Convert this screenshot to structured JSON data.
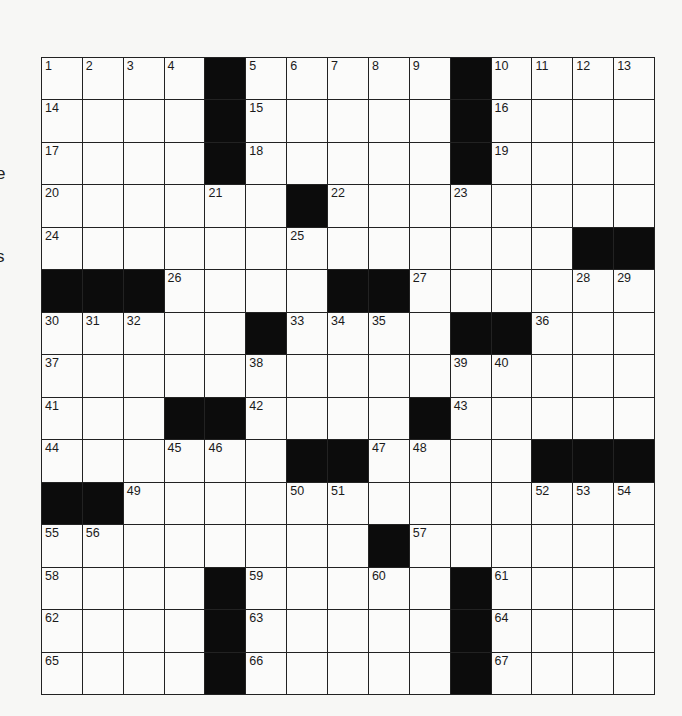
{
  "puzzle": {
    "type": "crossword",
    "size": {
      "rows": 15,
      "cols": 15
    },
    "margin_fragments": [
      {
        "text": "e",
        "top": 164
      },
      {
        "text": "s",
        "top": 247
      }
    ],
    "grid": [
      [
        "1",
        "2",
        "3",
        "4",
        "#",
        "5",
        "6",
        "7",
        "8",
        "9",
        "#",
        "10",
        "11",
        "12",
        "13"
      ],
      [
        "14",
        ".",
        ".",
        ".",
        "#",
        "15",
        ".",
        ".",
        ".",
        ".",
        "#",
        "16",
        ".",
        ".",
        "."
      ],
      [
        "17",
        ".",
        ".",
        ".",
        "#",
        "18",
        ".",
        ".",
        ".",
        ".",
        "#",
        "19",
        ".",
        ".",
        "."
      ],
      [
        "20",
        ".",
        ".",
        ".",
        "21",
        ".",
        "#",
        "22",
        ".",
        ".",
        "23",
        ".",
        ".",
        ".",
        "."
      ],
      [
        "24",
        ".",
        ".",
        ".",
        ".",
        ".",
        "25",
        ".",
        ".",
        ".",
        ".",
        ".",
        ".",
        "#",
        "#"
      ],
      [
        "#",
        "#",
        "#",
        "26",
        ".",
        ".",
        ".",
        "#",
        "#",
        "27",
        ".",
        ".",
        ".",
        "28",
        "29"
      ],
      [
        "30",
        "31",
        "32",
        ".",
        ".",
        "#",
        "33",
        "34",
        "35",
        ".",
        "#",
        "#",
        "36",
        ".",
        "."
      ],
      [
        "37",
        ".",
        ".",
        ".",
        ".",
        "38",
        ".",
        ".",
        ".",
        ".",
        "39",
        "40",
        ".",
        ".",
        "."
      ],
      [
        "41",
        ".",
        ".",
        "#",
        "#",
        "42",
        ".",
        ".",
        ".",
        "#",
        "43",
        ".",
        ".",
        ".",
        "."
      ],
      [
        "44",
        ".",
        ".",
        "45",
        "46",
        ".",
        "#",
        "#",
        "47",
        "48",
        ".",
        ".",
        "#",
        "#",
        "#"
      ],
      [
        "#",
        "#",
        "49",
        ".",
        ".",
        ".",
        "50",
        "51",
        ".",
        ".",
        ".",
        ".",
        "52",
        "53",
        "54"
      ],
      [
        "55",
        "56",
        ".",
        ".",
        ".",
        ".",
        ".",
        ".",
        "#",
        "57",
        ".",
        ".",
        ".",
        ".",
        "."
      ],
      [
        "58",
        ".",
        ".",
        ".",
        "#",
        "59",
        ".",
        ".",
        "60",
        ".",
        "#",
        "61",
        ".",
        ".",
        "."
      ],
      [
        "62",
        ".",
        ".",
        ".",
        "#",
        "63",
        ".",
        ".",
        ".",
        ".",
        "#",
        "64",
        ".",
        ".",
        "."
      ],
      [
        "65",
        ".",
        ".",
        ".",
        "#",
        "66",
        ".",
        ".",
        ".",
        ".",
        "#",
        "67",
        ".",
        ".",
        "."
      ]
    ],
    "colors": {
      "black_square": "#0c0c0c",
      "white_square": "#fbfbfa",
      "grid_line": "#222222"
    }
  }
}
